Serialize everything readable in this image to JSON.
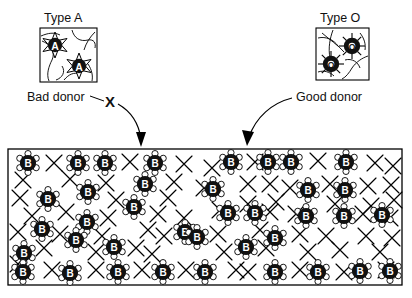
{
  "figure": {
    "kind": "blood-type-compatibility-diagram",
    "background_color": "#ffffff",
    "ink_color": "#000000",
    "width": 412,
    "height": 298
  },
  "labels": {
    "type_a": "Type A",
    "type_o": "Type O",
    "bad_donor": "Bad donor",
    "good_donor": "Good donor",
    "reject_mark": "X"
  },
  "donor_boxes": [
    {
      "id": "type-a-box",
      "title": "Type A",
      "verdict": "Bad donor",
      "cell_letter": "A",
      "cell_count": 2,
      "cell_style": "star-spiked",
      "x": 40,
      "y": 28,
      "width": 57,
      "height": 54,
      "cells": [
        {
          "cx": 55,
          "cy": 45,
          "label": "A"
        },
        {
          "cx": 79,
          "cy": 66,
          "label": "A"
        }
      ]
    },
    {
      "id": "type-o-box",
      "title": "Type O",
      "verdict": "Good donor",
      "cell_letter": "O",
      "cell_count": 2,
      "cell_style": "sunburst-ring",
      "x": 316,
      "y": 28,
      "width": 53,
      "height": 52,
      "cells": [
        {
          "cx": 352,
          "cy": 46,
          "label": "O"
        },
        {
          "cx": 331,
          "cy": 64,
          "label": "O"
        }
      ]
    }
  ],
  "arrows": [
    {
      "id": "bad-donor-arrow",
      "from_label": "Bad donor",
      "blocked": true,
      "marker": "X",
      "marker_x": 110,
      "marker_y": 101,
      "path": "M 118 104 C 132 112, 139 125, 141 140",
      "tip_x": 141,
      "tip_y": 146
    },
    {
      "id": "good-donor-arrow",
      "from_label": "Good donor",
      "blocked": false,
      "marker": null,
      "path": "M 292 98 C 272 104, 255 118, 248 138",
      "tip_x": 247,
      "tip_y": 145
    }
  ],
  "recipient": {
    "id": "recipient-blood-field",
    "description": "Type B recipient blood with B antigen cells and antibody X marks",
    "cell_letter": "B",
    "rect": {
      "x": 8,
      "y": 149,
      "width": 394,
      "height": 136
    },
    "cell_count": 38,
    "antibody_count": 68,
    "cells": [
      {
        "cx": 28,
        "cy": 163
      },
      {
        "cx": 78,
        "cy": 163
      },
      {
        "cx": 105,
        "cy": 163
      },
      {
        "cx": 155,
        "cy": 163
      },
      {
        "cx": 231,
        "cy": 162
      },
      {
        "cx": 268,
        "cy": 162
      },
      {
        "cx": 291,
        "cy": 162
      },
      {
        "cx": 346,
        "cy": 162
      },
      {
        "cx": 145,
        "cy": 184
      },
      {
        "cx": 88,
        "cy": 192
      },
      {
        "cx": 48,
        "cy": 199
      },
      {
        "cx": 213,
        "cy": 189
      },
      {
        "cx": 308,
        "cy": 190
      },
      {
        "cx": 345,
        "cy": 190
      },
      {
        "cx": 134,
        "cy": 207
      },
      {
        "cx": 87,
        "cy": 222
      },
      {
        "cx": 42,
        "cy": 229
      },
      {
        "cx": 228,
        "cy": 213
      },
      {
        "cx": 255,
        "cy": 213
      },
      {
        "cx": 306,
        "cy": 216
      },
      {
        "cx": 344,
        "cy": 216
      },
      {
        "cx": 382,
        "cy": 215
      },
      {
        "cx": 185,
        "cy": 232
      },
      {
        "cx": 76,
        "cy": 240
      },
      {
        "cx": 114,
        "cy": 247
      },
      {
        "cx": 24,
        "cy": 253
      },
      {
        "cx": 190,
        "cy": 246
      },
      {
        "cx": 197,
        "cy": 237
      },
      {
        "cx": 246,
        "cy": 247
      },
      {
        "cx": 275,
        "cy": 238
      },
      {
        "cx": 23,
        "cy": 272
      },
      {
        "cx": 70,
        "cy": 273
      },
      {
        "cx": 118,
        "cy": 272
      },
      {
        "cx": 163,
        "cy": 272
      },
      {
        "cx": 205,
        "cy": 272
      },
      {
        "cx": 275,
        "cy": 272
      },
      {
        "cx": 318,
        "cy": 272
      },
      {
        "cx": 360,
        "cy": 271
      }
    ]
  }
}
